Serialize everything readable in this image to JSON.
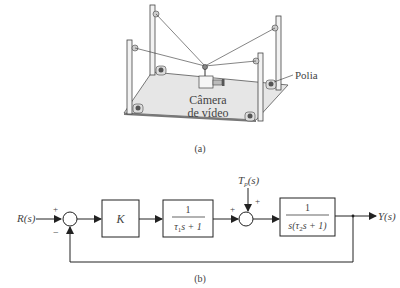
{
  "figure_a": {
    "camera_label_line1": "Câmera",
    "camera_label_line2": "de vídeo",
    "pulley_label": "Polia",
    "caption": "(a)"
  },
  "figure_b": {
    "input": "R(s)",
    "output": "Y(s)",
    "disturbance_main": "T",
    "disturbance_sub": "p",
    "disturbance_arg": "(s)",
    "sum1_plus": "+",
    "sum1_minus": "−",
    "sum2_plus_left": "+",
    "sum2_plus_top": "+",
    "block_gain": "K",
    "block1_num": "1",
    "block1_den_tau": "τ",
    "block1_den_sub": "1",
    "block1_den_rest": "s + 1",
    "block2_num": "1",
    "block2_den_pre": "s(τ",
    "block2_den_sub": "2",
    "block2_den_rest": "s + 1)",
    "caption": "(b)"
  },
  "colors": {
    "line": "#222222",
    "board": "#e8e8e8",
    "board_edge": "#555555",
    "text": "#444444"
  }
}
